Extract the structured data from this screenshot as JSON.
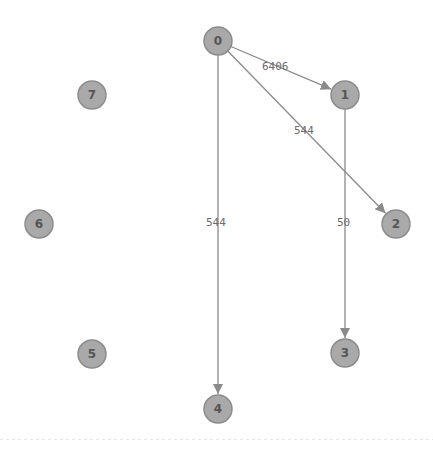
{
  "diagram": {
    "type": "directed-graph",
    "colors": {
      "node_fill": "#a9a9a9",
      "node_stroke": "#8c8c8c",
      "node_text": "#555555",
      "edge": "#8a8a8a",
      "edge_label": "#6a6a6a",
      "background": "#ffffff"
    },
    "nodes": [
      {
        "id": "0",
        "label": "0",
        "x": 218,
        "y": 41
      },
      {
        "id": "1",
        "label": "1",
        "x": 345,
        "y": 95
      },
      {
        "id": "2",
        "label": "2",
        "x": 396,
        "y": 224
      },
      {
        "id": "3",
        "label": "3",
        "x": 345,
        "y": 353
      },
      {
        "id": "4",
        "label": "4",
        "x": 218,
        "y": 409
      },
      {
        "id": "5",
        "label": "5",
        "x": 92,
        "y": 354
      },
      {
        "id": "6",
        "label": "6",
        "x": 39,
        "y": 224
      },
      {
        "id": "7",
        "label": "7",
        "x": 92,
        "y": 95
      }
    ],
    "edges": [
      {
        "from": "0",
        "to": "1",
        "label": "6406",
        "lx": 262,
        "ly": 70
      },
      {
        "from": "0",
        "to": "2",
        "label": "544",
        "lx": 294,
        "ly": 134
      },
      {
        "from": "0",
        "to": "4",
        "label": "544",
        "lx": 206,
        "ly": 226
      },
      {
        "from": "1",
        "to": "3",
        "label": "50",
        "lx": 337,
        "ly": 226
      }
    ]
  }
}
